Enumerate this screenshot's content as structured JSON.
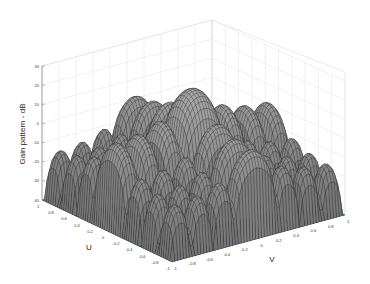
{
  "chart_data": {
    "type": "surface3d",
    "title": "",
    "xlabel": "U",
    "ylabel": "V",
    "zlabel": "Gain pattern - dB",
    "zlim": [
      -40,
      30
    ],
    "xlim": [
      -1,
      1
    ],
    "ylim": [
      -1,
      1
    ],
    "z_ticks": [
      "30",
      "20",
      "10",
      "0",
      "-10",
      "-20",
      "-30",
      "-40"
    ],
    "u_ticks": [
      "1",
      "0.8",
      "0.6",
      "0.4",
      "0.2",
      "0",
      "-0.2",
      "-0.4",
      "-0.6",
      "-0.8",
      "-1"
    ],
    "v_ticks": [
      "-1",
      "-0.8",
      "-0.6",
      "-0.4",
      "-0.2",
      "0",
      "0.2",
      "0.4",
      "0.6",
      "0.8",
      "1"
    ],
    "grid": true,
    "colormap": "gray",
    "main_lobe_peak_db": 22,
    "side_lobes_u_axis_db": [
      -5,
      -12,
      -16,
      -18,
      -20,
      -22
    ],
    "side_lobes_v_axis_db": [
      -5,
      -12,
      -16,
      -18,
      -20,
      -22
    ],
    "floor_db": -40
  }
}
